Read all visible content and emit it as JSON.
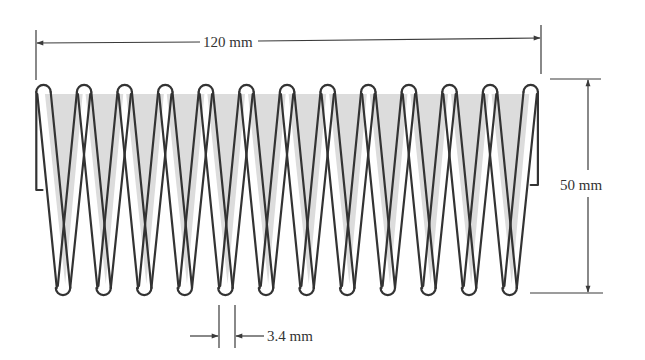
{
  "figure": {
    "type": "helical compression spring, side view",
    "colors": {
      "line": "#333333",
      "shade": "#dcdcdc",
      "background": "#ffffff"
    },
    "coils": {
      "top_loops": 13,
      "bottom_loops": 12
    }
  },
  "dimensions": {
    "length": {
      "label": "120 mm",
      "value": 120,
      "unit": "mm"
    },
    "diameter": {
      "label": "50 mm",
      "value": 50,
      "unit": "mm"
    },
    "wire_diameter": {
      "label": "3.4 mm",
      "value": 3.4,
      "unit": "mm"
    }
  }
}
